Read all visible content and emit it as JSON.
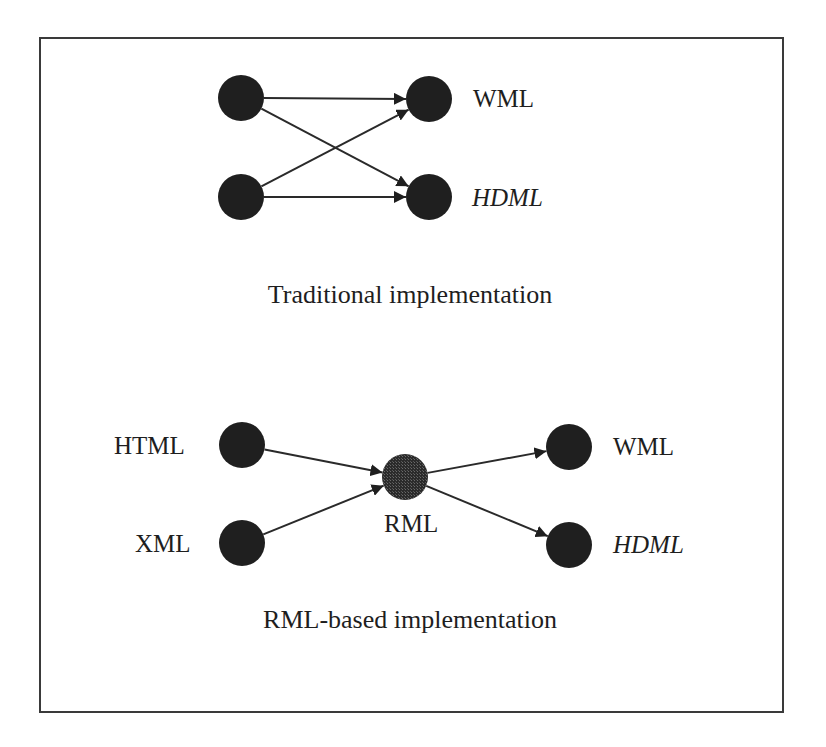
{
  "colors": {
    "node": "#1f1f1f",
    "hub_node": "#3a3a3a",
    "edge": "#2a2a2a",
    "frame": "#3a3a3a",
    "text": "#1e1e1e"
  },
  "node_radius": 23,
  "diagrams": [
    {
      "id": "traditional",
      "caption": "Traditional implementation",
      "caption_pos": {
        "x": 410,
        "y": 303
      },
      "nodes": [
        {
          "id": "src1",
          "x": 241,
          "y": 98,
          "label": "",
          "hub": false
        },
        {
          "id": "src2",
          "x": 241,
          "y": 197,
          "label": "",
          "hub": false
        },
        {
          "id": "wml",
          "x": 429,
          "y": 99,
          "label": "WML",
          "italic": false,
          "label_x": 473,
          "label_y": 107,
          "hub": false
        },
        {
          "id": "hdml",
          "x": 429,
          "y": 197,
          "label": "HDML",
          "italic": true,
          "label_x": 472,
          "label_y": 206,
          "hub": false
        }
      ],
      "edges": [
        {
          "from": "src1",
          "to": "wml"
        },
        {
          "from": "src1",
          "to": "hdml"
        },
        {
          "from": "src2",
          "to": "wml"
        },
        {
          "from": "src2",
          "to": "hdml"
        }
      ]
    },
    {
      "id": "rml-based",
      "caption": "RML-based implementation",
      "caption_pos": {
        "x": 410,
        "y": 628
      },
      "nodes": [
        {
          "id": "html",
          "x": 242,
          "y": 445,
          "label": "HTML",
          "italic": false,
          "label_x": 114,
          "label_y": 454,
          "hub": false
        },
        {
          "id": "xml",
          "x": 242,
          "y": 543,
          "label": "XML",
          "italic": false,
          "label_x": 135,
          "label_y": 552,
          "hub": false
        },
        {
          "id": "rml",
          "x": 405,
          "y": 477,
          "label": "RML",
          "italic": false,
          "label_x": 384,
          "label_y": 532,
          "hub": true
        },
        {
          "id": "wml2",
          "x": 569,
          "y": 447,
          "label": "WML",
          "italic": false,
          "label_x": 613,
          "label_y": 455,
          "hub": false
        },
        {
          "id": "hdml2",
          "x": 569,
          "y": 545,
          "label": "HDML",
          "italic": true,
          "label_x": 613,
          "label_y": 553,
          "hub": false
        }
      ],
      "edges": [
        {
          "from": "html",
          "to": "rml"
        },
        {
          "from": "xml",
          "to": "rml"
        },
        {
          "from": "rml",
          "to": "wml2"
        },
        {
          "from": "rml",
          "to": "hdml2"
        }
      ]
    }
  ]
}
